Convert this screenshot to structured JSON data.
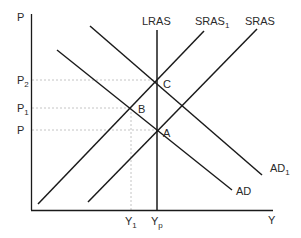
{
  "diagram": {
    "type": "AD-AS model",
    "axes": {
      "y_label": "P",
      "x_label": "Y"
    },
    "price_levels": [
      {
        "main": "P",
        "sub": "2",
        "y": 80
      },
      {
        "main": "P",
        "sub": "1",
        "y": 108
      },
      {
        "main": "P",
        "sub": "",
        "y": 130
      }
    ],
    "output_levels": [
      {
        "main": "Y",
        "sub": "1",
        "x": 131
      },
      {
        "main": "Y",
        "sub": "p",
        "x": 157
      }
    ],
    "curves": [
      {
        "name": "LRAS",
        "main": "LRAS",
        "sub": "",
        "x1": 157,
        "y1": 30,
        "x2": 157,
        "y2": 210
      },
      {
        "name": "SRAS1",
        "main": "SRAS",
        "sub": "1",
        "x1": 38,
        "y1": 204,
        "x2": 204,
        "y2": 31
      },
      {
        "name": "SRAS",
        "main": "SRAS",
        "sub": "",
        "x1": 88,
        "y1": 202,
        "x2": 257,
        "y2": 29
      },
      {
        "name": "AD1",
        "main": "AD",
        "sub": "1",
        "x1": 90,
        "y1": 26,
        "x2": 262,
        "y2": 175
      },
      {
        "name": "AD",
        "main": "AD",
        "sub": "",
        "x1": 57,
        "y1": 50,
        "x2": 232,
        "y2": 190
      }
    ],
    "points": [
      {
        "label": "C",
        "x": 157,
        "y": 80
      },
      {
        "label": "B",
        "x": 131,
        "y": 108
      },
      {
        "label": "A",
        "x": 157,
        "y": 130
      }
    ],
    "colors": {
      "line": "#1a1a1a",
      "guide": "#bdbdbd",
      "text": "#2a2a2a"
    }
  }
}
